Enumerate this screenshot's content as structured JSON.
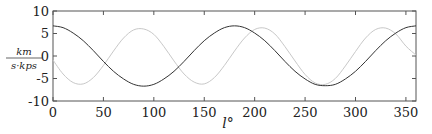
{
  "chart_data": {
    "type": "line",
    "title": "",
    "xlabel": "l°",
    "ylabel": "km / (s·kps)",
    "ylabel_numerator": "km",
    "ylabel_denominator": "s·kps",
    "xlim": [
      0,
      360
    ],
    "ylim": [
      -10,
      10
    ],
    "xticks": [
      0,
      50,
      100,
      150,
      200,
      250,
      300,
      350
    ],
    "yticks": [
      10,
      5,
      0,
      -5,
      -10
    ],
    "xtick_labels": [
      "0",
      "50",
      "100",
      "150",
      "200",
      "250",
      "300",
      "350"
    ],
    "ytick_labels": [
      "10",
      "5",
      "0",
      "-5",
      "-10"
    ],
    "grid": false,
    "legend": null,
    "x": [
      0,
      10,
      20,
      30,
      40,
      50,
      60,
      70,
      80,
      90,
      100,
      110,
      120,
      130,
      140,
      150,
      160,
      170,
      180,
      190,
      200,
      210,
      220,
      230,
      240,
      250,
      260,
      270,
      280,
      290,
      300,
      310,
      320,
      330,
      340,
      350,
      360
    ],
    "series": [
      {
        "name": "dark curve",
        "color": "#333333",
        "values": [
          6.7,
          6.3,
          5.1,
          3.4,
          1.2,
          -1.2,
          -3.4,
          -5.1,
          -6.3,
          -6.7,
          -6.3,
          -5.1,
          -3.4,
          -1.2,
          1.2,
          3.4,
          5.1,
          6.3,
          6.7,
          6.3,
          5.1,
          3.4,
          1.2,
          -1.2,
          -3.4,
          -5.1,
          -6.3,
          -6.6,
          -6.3,
          -5.1,
          -3.4,
          -1.2,
          1.2,
          3.4,
          5.1,
          6.3,
          6.7
        ]
      },
      {
        "name": "light curve",
        "color": "#c8c8c8",
        "values": [
          -0.9,
          -4.0,
          -5.9,
          -6.2,
          -4.8,
          -2.1,
          1.1,
          4.0,
          5.8,
          6.0,
          4.8,
          2.1,
          -1.1,
          -4.0,
          -5.8,
          -6.2,
          -4.8,
          -2.1,
          1.1,
          4.0,
          5.9,
          6.2,
          4.9,
          2.1,
          -1.1,
          -4.1,
          -6.0,
          -6.3,
          -5.0,
          -2.2,
          1.0,
          4.0,
          5.9,
          6.2,
          4.9,
          2.2,
          0.2
        ]
      }
    ]
  },
  "plot_area": {
    "left": 53,
    "top": 11,
    "right": 416,
    "bottom": 101
  }
}
